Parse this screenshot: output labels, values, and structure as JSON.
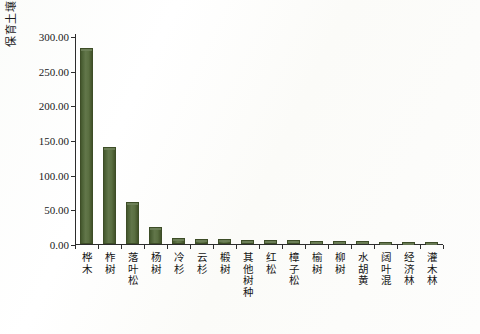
{
  "chart_data": {
    "type": "bar",
    "title": "",
    "xlabel": "",
    "ylabel": "保育土壤（亿元/年）",
    "ylim": [
      0,
      300
    ],
    "yticks": [
      0,
      50,
      100,
      150,
      200,
      250,
      300
    ],
    "ytick_labels": [
      "0.00",
      "50.00",
      "100.00",
      "150.00",
      "200.00",
      "250.00",
      "300.00"
    ],
    "grid": false,
    "legend": null,
    "bar_color": "#51663a",
    "axis_color": "#2d2d2d",
    "background_color": "#fdfdfb",
    "categories": [
      "桦木",
      "柞树",
      "落叶松",
      "杨树",
      "冷杉",
      "云杉",
      "椴树",
      "其他树种",
      "红松",
      "樟子松",
      "榆树",
      "柳树",
      "水胡黄",
      "阔叶混",
      "经济林",
      "灌木林"
    ],
    "values": [
      283.0,
      140.5,
      60.5,
      24.0,
      8.5,
      7.5,
      7.0,
      6.5,
      6.0,
      5.5,
      5.0,
      4.5,
      4.0,
      3.5,
      3.0,
      3.0
    ]
  }
}
